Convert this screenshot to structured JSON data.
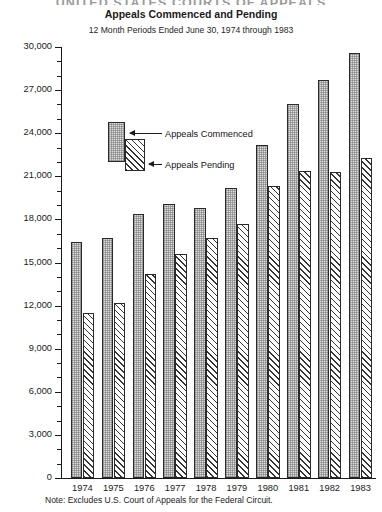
{
  "titles": {
    "main": "UNITED STATES COURTS OF APPEALS",
    "sub": "Appeals Commenced and Pending",
    "sub2": "12 Month Periods Ended June 30, 1974 through 1983"
  },
  "legend": {
    "commenced_label": "Appeals Commenced",
    "pending_label": "Appeals Pending"
  },
  "note": "Note:  Excludes U.S. Court of Appeals for the Federal Circuit.",
  "colors": {
    "commenced_fill": "#dcdcdc",
    "pending_fill": "#ffffff",
    "outline": "#2a2a2a",
    "axis": "#1a1a1a"
  },
  "chart_data": {
    "type": "bar",
    "title": "Appeals Commenced and Pending",
    "subtitle": "12 Month Periods Ended June 30, 1974 through 1983",
    "xlabel": "",
    "ylabel": "",
    "ylim": [
      0,
      30000
    ],
    "ytick_step": 3000,
    "yticks": [
      0,
      3000,
      6000,
      9000,
      12000,
      15000,
      18000,
      21000,
      24000,
      27000,
      30000
    ],
    "ytick_labels": [
      "0",
      "3,000",
      "6,000",
      "9,000",
      "12,000",
      "15,000",
      "18,000",
      "21,000",
      "24,000",
      "27,000",
      "30,000"
    ],
    "minor_ticks_per_interval": 2,
    "grid": false,
    "legend_position": "inside-upper-left",
    "categories": [
      "1974",
      "1975",
      "1976",
      "1977",
      "1978",
      "1979",
      "1980",
      "1981",
      "1982",
      "1983"
    ],
    "series": [
      {
        "name": "Appeals Commenced",
        "values": [
          16400,
          16700,
          18400,
          19100,
          18800,
          20200,
          23200,
          26000,
          27700,
          29600
        ]
      },
      {
        "name": "Appeals Pending",
        "values": [
          11500,
          12200,
          14200,
          15600,
          16700,
          17700,
          20300,
          21400,
          21300,
          22300
        ]
      }
    ],
    "annotations": [
      "Note:  Excludes U.S. Court of Appeals for the Federal Circuit."
    ]
  }
}
